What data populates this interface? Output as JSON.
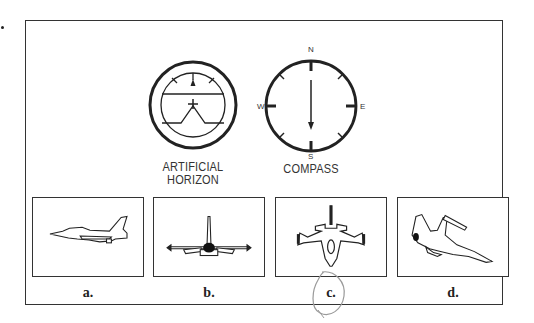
{
  "figure": {
    "instruments": [
      {
        "name": "artificial-horizon",
        "label_line1": "ARTIFICIAL",
        "label_line2": "HORIZON"
      },
      {
        "name": "compass",
        "label": "COMPASS",
        "directions": {
          "north": "N",
          "south": "S",
          "east": "E",
          "west": "W"
        },
        "needle_pointing": "S"
      }
    ],
    "options": [
      {
        "label": "a.",
        "view": "side view of jet"
      },
      {
        "label": "b.",
        "view": "rear view of jet, level"
      },
      {
        "label": "c.",
        "view": "top view of jet, nose pointing down (south)",
        "circled": true
      },
      {
        "label": "d.",
        "view": "banked jet in angled view"
      }
    ],
    "colors": {
      "ink": "#333333",
      "pencil_mark": "#9a9a9a",
      "background": "#ffffff"
    }
  }
}
